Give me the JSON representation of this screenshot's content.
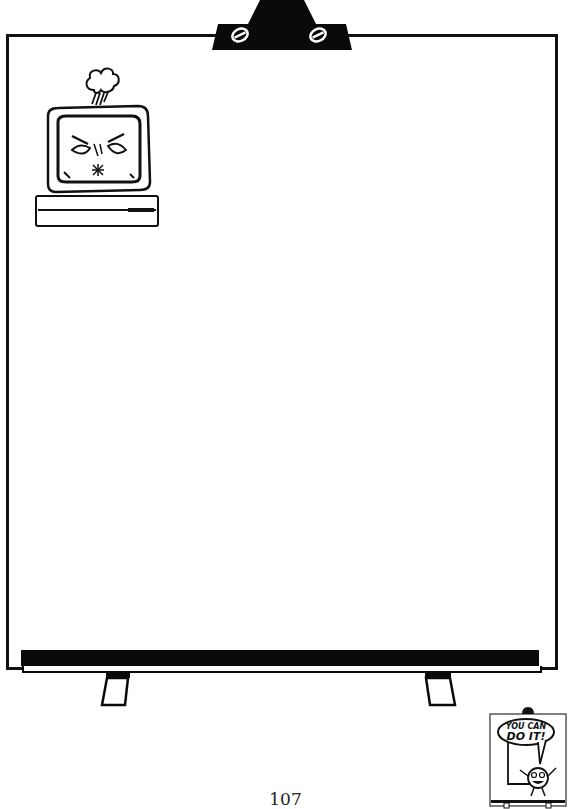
{
  "page": {
    "number": "107"
  },
  "illustrations": {
    "flipchart": "flipchart-board-icon",
    "monitor": "sad-computer-monitor-icon",
    "cloud": "rain-cloud-icon",
    "mascot": "you-can-do-it-mascot-icon"
  },
  "mascot": {
    "line1": "YOU CAN",
    "line2": "DO IT!"
  },
  "colors": {
    "ink": "#111111",
    "paper": "#ffffff"
  }
}
